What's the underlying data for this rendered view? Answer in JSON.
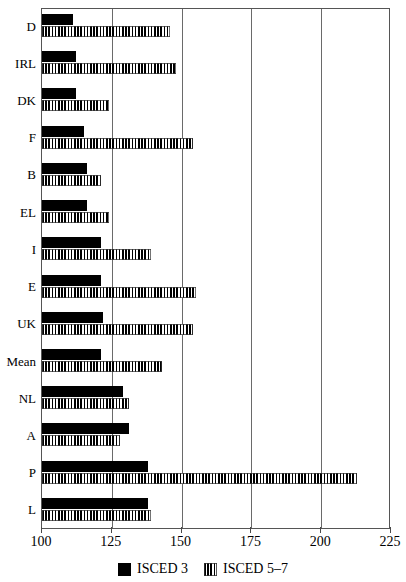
{
  "chart_data": {
    "type": "bar",
    "orientation": "horizontal",
    "title": "",
    "subtitle": "",
    "xlabel": "",
    "ylabel": "",
    "xlim": [
      100,
      225
    ],
    "xticks": [
      100,
      125,
      150,
      175,
      200,
      225
    ],
    "xtick_labels": [
      "100",
      "125",
      "150",
      "175",
      "200",
      "225"
    ],
    "grid": "vertical",
    "legend_position": "bottom-center",
    "categories": [
      "D",
      "IRL",
      "DK",
      "F",
      "B",
      "EL",
      "I",
      "E",
      "UK",
      "Mean",
      "NL",
      "A",
      "P",
      "L"
    ],
    "series": [
      {
        "name": "ISCED 3",
        "fill": "solid-black",
        "color": "#000000",
        "values": [
          111,
          112,
          112,
          115,
          116,
          116,
          121,
          121,
          122,
          121,
          129,
          131,
          138,
          138
        ]
      },
      {
        "name": "ISCED 5–7",
        "fill": "vertical-stripes",
        "color": "#000000",
        "values": [
          146,
          148,
          124,
          154,
          121,
          124,
          139,
          155,
          154,
          143,
          131,
          128,
          213,
          139
        ]
      }
    ]
  },
  "legend": {
    "items": [
      {
        "label": "ISCED 3",
        "swatch": "solid-black"
      },
      {
        "label": "ISCED 5–7",
        "swatch": "vertical-stripes"
      }
    ]
  },
  "colors": {
    "background": "#ffffff",
    "axis": "#555555",
    "gridline": "#6a6a6a",
    "bar": "#000000"
  }
}
